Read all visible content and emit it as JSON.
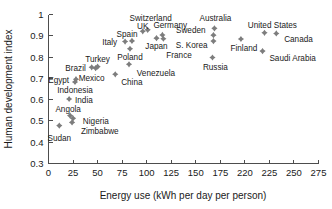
{
  "chart_data": {
    "type": "scatter",
    "title": "",
    "xlabel": "Energy use (kWh per day per person)",
    "ylabel": "Human development index",
    "xlim": [
      0,
      275
    ],
    "ylim": [
      0.3,
      1
    ],
    "grid": false,
    "legend": "none",
    "marker_color": "#7d7d7d",
    "marker_shape": "diamond",
    "xticks": [
      "0",
      "25",
      "50",
      "75",
      "100",
      "125",
      "150",
      "175",
      "220",
      "225",
      "250",
      "275"
    ],
    "xtick_values": [
      0,
      25,
      50,
      75,
      100,
      125,
      150,
      175,
      200,
      225,
      250,
      275
    ],
    "yticks": [
      "0.3",
      "0.4",
      "0.5",
      "0.6",
      "0.7",
      "0.8",
      "0.9",
      "1"
    ],
    "ytick_values": [
      0.3,
      0.4,
      0.5,
      0.6,
      0.7,
      0.8,
      0.9,
      1.0
    ],
    "points": [
      {
        "name": "Sudan",
        "x": 11,
        "y": 0.478,
        "lx": 11,
        "ly": 0.418,
        "anchor": "middle"
      },
      {
        "name": "Zimbabwe",
        "x": 24,
        "y": 0.493,
        "lx": 33,
        "ly": 0.452,
        "anchor": "start"
      },
      {
        "name": "Nigeria",
        "x": 25,
        "y": 0.512,
        "lx": 35,
        "ly": 0.5,
        "anchor": "start"
      },
      {
        "name": "Angola",
        "x": 22,
        "y": 0.525,
        "lx": 20,
        "ly": 0.556,
        "anchor": "middle"
      },
      {
        "name": "India",
        "x": 21,
        "y": 0.603,
        "lx": 27,
        "ly": 0.596,
        "anchor": "start"
      },
      {
        "name": "Indonesia",
        "x": 27,
        "y": 0.683,
        "lx": 27,
        "ly": 0.643,
        "anchor": "middle"
      },
      {
        "name": "Egypt",
        "x": 28,
        "y": 0.696,
        "lx": 21,
        "ly": 0.694,
        "anchor": "end"
      },
      {
        "name": "Mexico",
        "x": 48,
        "y": 0.748,
        "lx": 44,
        "ly": 0.7,
        "anchor": "middle"
      },
      {
        "name": "Brazil",
        "x": 44,
        "y": 0.752,
        "lx": 38,
        "ly": 0.748,
        "anchor": "end"
      },
      {
        "name": "Turkey",
        "x": 50,
        "y": 0.755,
        "lx": 50,
        "ly": 0.792,
        "anchor": "middle"
      },
      {
        "name": "China",
        "x": 68,
        "y": 0.719,
        "lx": 74,
        "ly": 0.681,
        "anchor": "start"
      },
      {
        "name": "Venezuela",
        "x": 82,
        "y": 0.766,
        "lx": 90,
        "ly": 0.726,
        "anchor": "start"
      },
      {
        "name": "Poland",
        "x": 83,
        "y": 0.839,
        "lx": 83,
        "ly": 0.8,
        "anchor": "middle"
      },
      {
        "name": "Italy",
        "x": 78,
        "y": 0.873,
        "lx": 70,
        "ly": 0.872,
        "anchor": "end"
      },
      {
        "name": "Spain",
        "x": 85,
        "y": 0.876,
        "lx": 80,
        "ly": 0.908,
        "anchor": "middle"
      },
      {
        "name": "UK",
        "x": 96,
        "y": 0.921,
        "lx": 96,
        "ly": 0.945,
        "anchor": "middle"
      },
      {
        "name": "Switzerland",
        "x": 101,
        "y": 0.928,
        "lx": 104,
        "ly": 0.985,
        "anchor": "middle"
      },
      {
        "name": "Japan",
        "x": 110,
        "y": 0.889,
        "lx": 110,
        "ly": 0.852,
        "anchor": "middle"
      },
      {
        "name": "Germany",
        "x": 116,
        "y": 0.904,
        "lx": 124,
        "ly": 0.952,
        "anchor": "middle"
      },
      {
        "name": "France",
        "x": 117,
        "y": 0.886,
        "lx": 133,
        "ly": 0.812,
        "anchor": "middle"
      },
      {
        "name": "Sweden",
        "x": 168,
        "y": 0.903,
        "lx": 160,
        "ly": 0.928,
        "anchor": "end"
      },
      {
        "name": "Australia",
        "x": 169,
        "y": 0.935,
        "lx": 170,
        "ly": 0.985,
        "anchor": "middle"
      },
      {
        "name": "S. Korea",
        "x": 168,
        "y": 0.875,
        "lx": 162,
        "ly": 0.858,
        "anchor": "end"
      },
      {
        "name": "Russia",
        "x": 167,
        "y": 0.798,
        "lx": 170,
        "ly": 0.752,
        "anchor": "middle"
      },
      {
        "name": "Finland",
        "x": 196,
        "y": 0.885,
        "lx": 199,
        "ly": 0.842,
        "anchor": "middle"
      },
      {
        "name": "United States",
        "x": 220,
        "y": 0.914,
        "lx": 228,
        "ly": 0.952,
        "anchor": "middle"
      },
      {
        "name": "Canada",
        "x": 232,
        "y": 0.911,
        "lx": 240,
        "ly": 0.886,
        "anchor": "start"
      },
      {
        "name": "Saudi Arabia",
        "x": 218,
        "y": 0.828,
        "lx": 225,
        "ly": 0.796,
        "anchor": "start"
      }
    ]
  }
}
